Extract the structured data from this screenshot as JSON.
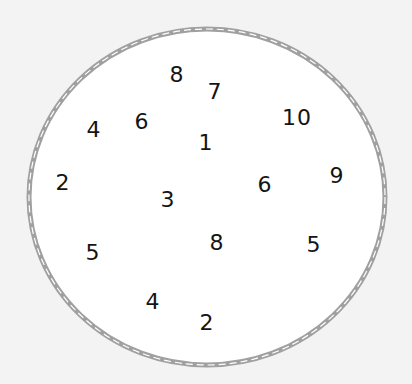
{
  "diagram": {
    "shape": "circle",
    "background_color": "#f3f3f3",
    "fill_color": "#ffffff",
    "outline_color": "#a0a0a0",
    "outline_dash_color": "#ffffff",
    "ellipse": {
      "cx": 207,
      "cy": 197,
      "rx": 178,
      "ry": 168
    },
    "numbers": [
      {
        "label": "8",
        "x": 177,
        "y": 75
      },
      {
        "label": "7",
        "x": 215,
        "y": 92
      },
      {
        "label": "4",
        "x": 94,
        "y": 130
      },
      {
        "label": "6",
        "x": 142,
        "y": 122
      },
      {
        "label": "1",
        "x": 206,
        "y": 143
      },
      {
        "label": "10",
        "x": 297,
        "y": 118
      },
      {
        "label": "2",
        "x": 63,
        "y": 183
      },
      {
        "label": "3",
        "x": 168,
        "y": 200
      },
      {
        "label": "6",
        "x": 265,
        "y": 185
      },
      {
        "label": "9",
        "x": 337,
        "y": 176
      },
      {
        "label": "5",
        "x": 93,
        "y": 253
      },
      {
        "label": "8",
        "x": 217,
        "y": 243
      },
      {
        "label": "5",
        "x": 314,
        "y": 245
      },
      {
        "label": "4",
        "x": 153,
        "y": 302
      },
      {
        "label": "2",
        "x": 207,
        "y": 323
      }
    ]
  }
}
